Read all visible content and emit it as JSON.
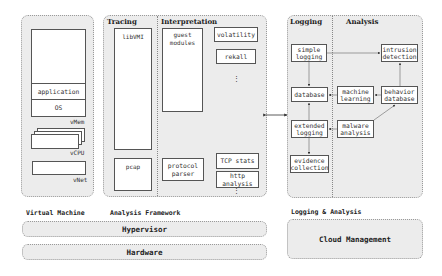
{
  "virtual_machine": {
    "label": "Virtual Machine",
    "vmem": {
      "label": "vMem",
      "layers": [
        "application",
        "OS"
      ]
    },
    "vcpu": {
      "label": "vCPU"
    },
    "vnet": {
      "label": "vNet"
    }
  },
  "analysis_framework": {
    "label": "Analysis Framework",
    "tracing": {
      "header": "Tracing",
      "libvmi": "libVMI",
      "pcap": "pcap"
    },
    "interpretation": {
      "header": "Interpretation",
      "guest_modules": "guest\nmodules",
      "volatility": "volatility",
      "rekall": "rekall",
      "protocol_parser": "protocol\nparser",
      "tcp_stats": "TCP stats",
      "http_analysis": "http\nanalysis",
      "ellipsis": "⋮"
    }
  },
  "logging_analysis": {
    "label": "Logging & Analysis",
    "logging": {
      "header": "Logging",
      "simple_logging": "simple\nlogging",
      "database": "database",
      "extended_logging": "extended\nlogging",
      "evidence_collection": "evidence\ncollection"
    },
    "analysis": {
      "header": "Analysis",
      "intrusion_detection": "intrusion\ndetection",
      "machine_learning": "machine\nlearning",
      "behavior_database": "behavior\ndatabase",
      "malware_analysis": "malware\nanalysis"
    }
  },
  "infrastructure": {
    "hypervisor": "Hypervisor",
    "hardware": "Hardware",
    "cloud_management": "Cloud Management"
  }
}
